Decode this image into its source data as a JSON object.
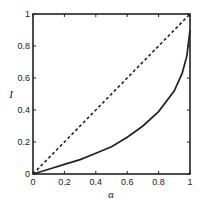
{
  "chart_data": {
    "type": "line",
    "title": "",
    "xlabel": "α",
    "ylabel": "I",
    "xlim": [
      0,
      1
    ],
    "ylim": [
      0,
      1
    ],
    "grid": false,
    "legend": null,
    "x_ticks": [
      "0",
      "0.2",
      "0.4",
      "0.6",
      "0.8",
      "1"
    ],
    "y_ticks": [
      "0",
      "0.2",
      "0.4",
      "0.6",
      "0.8",
      "1"
    ],
    "series": [
      {
        "name": "diagonal",
        "style": "dashed",
        "x": [
          0,
          1
        ],
        "y": [
          0,
          1
        ]
      },
      {
        "name": "curve",
        "style": "solid",
        "x": [
          0,
          0.1,
          0.2,
          0.3,
          0.4,
          0.5,
          0.6,
          0.7,
          0.8,
          0.9,
          0.95,
          0.98,
          1.0
        ],
        "y": [
          0,
          0.03,
          0.06,
          0.09,
          0.13,
          0.17,
          0.23,
          0.3,
          0.39,
          0.52,
          0.63,
          0.74,
          0.9
        ]
      }
    ]
  },
  "colors": {
    "line": "#222222",
    "axis": "#222222"
  }
}
